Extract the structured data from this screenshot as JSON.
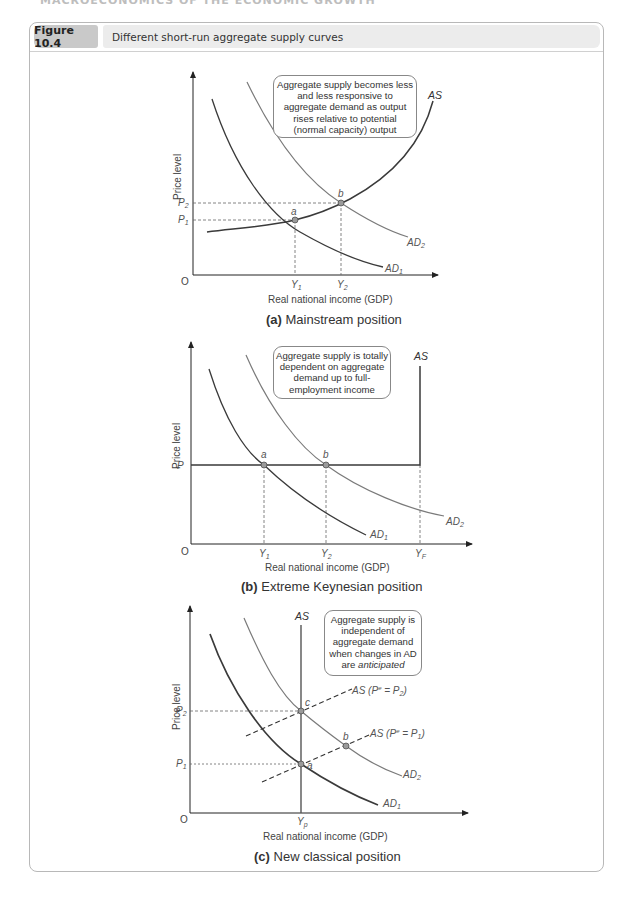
{
  "running_header": "MACROECONOMICS OF THE ECONOMIC GROWTH",
  "figure": {
    "number": "Figure 10.4",
    "title": "Different short-run aggregate supply curves"
  },
  "panels": [
    {
      "id": "a",
      "caption_letter": "(a)",
      "caption_text": "Mainstream position",
      "y_axis_label": "Price level",
      "x_axis_label": "Real national income (GDP)",
      "origin": "O",
      "callout": "Aggregate supply becomes less and less responsive to aggregate demand as output rises relative to potential (normal capacity) output",
      "curves": {
        "as": "AS",
        "ad1": "AD",
        "ad1_sub": "1",
        "ad2": "AD",
        "ad2_sub": "2"
      },
      "y_ticks": [
        {
          "main": "P",
          "sub": "2"
        },
        {
          "main": "P",
          "sub": "1"
        }
      ],
      "x_ticks": [
        {
          "main": "Y",
          "sub": "1"
        },
        {
          "main": "Y",
          "sub": "2"
        }
      ],
      "points": [
        "a",
        "b"
      ]
    },
    {
      "id": "b",
      "caption_letter": "(b)",
      "caption_text": "Extreme Keynesian position",
      "y_axis_label": "Price level",
      "x_axis_label": "Real national income (GDP)",
      "origin": "O",
      "callout": "Aggregate supply is totally dependent on aggregate demand up to full-employment income",
      "curves": {
        "as": "AS",
        "ad1": "AD",
        "ad1_sub": "1",
        "ad2": "AD",
        "ad2_sub": "2"
      },
      "y_ticks": [
        {
          "main": "P",
          "sub": ""
        }
      ],
      "x_ticks": [
        {
          "main": "Y",
          "sub": "1"
        },
        {
          "main": "Y",
          "sub": "2"
        },
        {
          "main": "Y",
          "sub": "F"
        }
      ],
      "points": [
        "a",
        "b"
      ]
    },
    {
      "id": "c",
      "caption_letter": "(c)",
      "caption_text": "New classical position",
      "y_axis_label": "Price level",
      "x_axis_label": "Real national income (GDP)",
      "origin": "O",
      "callout_before": "Aggregate supply is independent of aggregate demand when changes in AD are ",
      "callout_emph": "anticipated",
      "curves": {
        "as": "AS",
        "as_p2": "AS (P",
        "as_p2_sup": "e",
        "as_p2_eq": " = P",
        "as_p2_sub": "2",
        "as_p1": "AS (P",
        "as_p1_sup": "e",
        "as_p1_eq": " = P",
        "as_p1_sub": "1",
        "close": ")",
        "ad1": "AD",
        "ad1_sub": "1",
        "ad2": "AD",
        "ad2_sub": "2"
      },
      "y_ticks": [
        {
          "main": "P",
          "sub": "2"
        },
        {
          "main": "P",
          "sub": "1"
        }
      ],
      "x_ticks": [
        {
          "main": "Y",
          "sub": "p"
        }
      ],
      "points": [
        "c",
        "b",
        "a"
      ]
    }
  ],
  "colors": {
    "curve_dark": "#3a3a3a",
    "curve_light": "#7a7a7a",
    "point_fill": "#9a9a9a",
    "badge_bg": "#c9c9c9",
    "title_bg": "#ececec",
    "frame": "#b8b8b8"
  }
}
